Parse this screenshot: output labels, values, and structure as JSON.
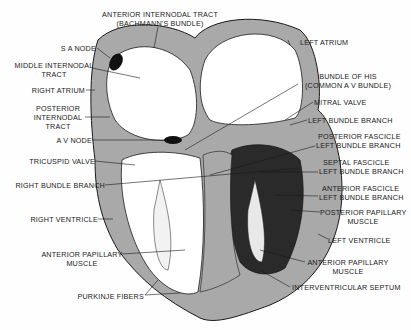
{
  "diagram": {
    "colors": {
      "wall": "#a8a8a8",
      "chamber": "#ffffff",
      "ink": "#1a1a1a",
      "node": "#111111"
    },
    "labels": {
      "anterior_internodal": [
        "ANTERIOR INTERNODAL TRACT",
        "(BACHMANN'S BUNDLE)"
      ],
      "sa_node": "S A NODE",
      "middle_internodal": [
        "MIDDLE INTERNODAL",
        "TRACT"
      ],
      "right_atrium": "RIGHT ATRIUM",
      "posterior_internodal": [
        "POSTERIOR",
        "INTERNODAL",
        "TRACT"
      ],
      "av_node": "A V NODE",
      "tricuspid_valve": "TRICUSPID VALVE",
      "right_bundle_branch": "RIGHT BUNDLE BRANCH",
      "right_ventricle": "RIGHT VENTRICLE",
      "anterior_papillary_left": [
        "ANTERIOR PAPILLARY",
        "MUSCLE"
      ],
      "purkinje_fibers": "PURKINJE FIBERS",
      "left_atrium": "LEFT ATRIUM",
      "bundle_of_his": [
        "BUNDLE OF HIS",
        "(COMMON A V BUNDLE)"
      ],
      "mitral_valve": "MITRAL VALVE",
      "left_bundle_branch": "LEFT BUNDLE BRANCH",
      "posterior_fascicle": [
        "POSTERIOR FASCICLE",
        "LEFT BUNDLE BRANCH"
      ],
      "septal_fascicle": [
        "SEPTAL FASCICLE",
        "LEFT BUNDLE BRANCH"
      ],
      "anterior_fascicle": [
        "ANTERIOR FASCICLE",
        "LEFT BUNDLE BRANCH"
      ],
      "posterior_papillary": [
        "POSTERIOR PAPILLARY",
        "MUSCLE"
      ],
      "left_ventricle": "LEFT VENTRICLE",
      "anterior_papillary_right": [
        "ANTERIOR PAPILLARY",
        "MUSCLE"
      ],
      "interventricular_septum": "INTERVENTRICULAR SEPTUM"
    }
  }
}
